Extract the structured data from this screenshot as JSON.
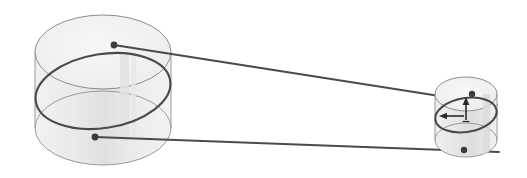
{
  "figure": {
    "type": "geometric-diagram",
    "width": 527,
    "height": 178,
    "background_color": "#ffffff"
  },
  "colors": {
    "cylinder_fill": "#ececeb",
    "cylinder_fill_top": "#f4f4f3",
    "cylinder_outline": "#8d8d8d",
    "orbit_stroke": "#4a4a4a",
    "connector_stroke": "#4a4a4a",
    "marker_fill": "#3c3c3c",
    "arrow_stroke": "#2a2a2a",
    "shadow_band": "#d9d9d8"
  },
  "left_cylinder": {
    "name": "large-cylinder",
    "center_x": 103,
    "top_center_y": 52,
    "bottom_center_y": 128,
    "radius_x": 68,
    "radius_y": 37,
    "height": 76,
    "fill": "#ececeb",
    "outline": "#8d8d8d",
    "outline_width": 1
  },
  "right_cylinder": {
    "name": "small-cylinder",
    "center_x": 466,
    "top_center_y": 94,
    "bottom_center_y": 140,
    "radius_x": 31,
    "radius_y": 17,
    "height": 46,
    "fill": "#ececeb",
    "outline": "#8d8d8d",
    "outline_width": 1
  },
  "left_orbit": {
    "name": "large-tilted-circle",
    "center_x": 103,
    "center_y": 91,
    "radius_x": 68,
    "radius_y": 37,
    "rotation_deg": -9,
    "stroke": "#4a4a4a",
    "stroke_width": 2.1
  },
  "right_orbit": {
    "name": "small-tilted-circle",
    "center_x": 466,
    "center_y": 115,
    "radius_x": 31,
    "radius_y": 17,
    "rotation_deg": -9,
    "stroke": "#4a4a4a",
    "stroke_width": 2.1
  },
  "markers": [
    {
      "name": "upper-left-point",
      "x": 114,
      "y": 45,
      "r": 3.4
    },
    {
      "name": "lower-left-point",
      "x": 95,
      "y": 137,
      "r": 3.4
    },
    {
      "name": "upper-right-point",
      "x": 472,
      "y": 94,
      "r": 3.2
    },
    {
      "name": "lower-right-point",
      "x": 464,
      "y": 150,
      "r": 3.2
    }
  ],
  "connectors": [
    {
      "name": "upper-connector-line",
      "x1": 114,
      "y1": 45,
      "x2": 497,
      "y2": 105,
      "stroke": "#4a4a4a",
      "stroke_width": 1.8
    },
    {
      "name": "lower-connector-line",
      "x1": 95,
      "y1": 137,
      "x2": 499,
      "y2": 152,
      "stroke": "#4a4a4a",
      "stroke_width": 1.8
    }
  ],
  "axis_arrows": {
    "origin_x": 466,
    "origin_y": 117,
    "vertical": {
      "name": "vertical-axis-arrow",
      "tip_x": 466,
      "tip_y": 99,
      "direction": "up"
    },
    "horizontal": {
      "name": "horizontal-axis-arrow",
      "tip_x": 440,
      "tip_y": 116,
      "direction": "left"
    },
    "stroke": "#2a2a2a",
    "stroke_width": 1.6
  },
  "labels": {
    "figure_description": "Two shaded cylinders joined by a pair of straight lines; each cylinder contains a tilted elliptical great circle with marked points, and the smaller cylinder carries a pair of axis arrows at its centre."
  }
}
